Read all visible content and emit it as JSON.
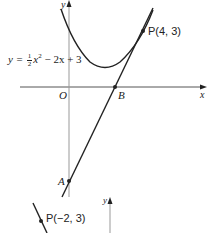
{
  "diagram": {
    "main_graph": {
      "x_axis_label": "x",
      "y_axis_label": "y",
      "origin_label": "O",
      "curve_equation": {
        "lhs": "y = ",
        "frac_num": "1",
        "frac_den": "2",
        "x_var": "x",
        "exp": "2",
        "rest": " − 2x + 3"
      },
      "points": [
        {
          "label": "P(4, 3)",
          "name": "P",
          "x": 4,
          "y": 3
        },
        {
          "label": "B",
          "name": "B",
          "x": 2.5,
          "y": 0
        },
        {
          "label": "A",
          "name": "A",
          "x": 0,
          "y": -5
        }
      ],
      "tangent_line": "y = 2x − 5"
    },
    "second_graph": {
      "y_axis_label": "y",
      "point_label": "P(−2, 3)"
    },
    "colors": {
      "curve": "#222222",
      "axis": "#888888",
      "background": "#ffffff"
    }
  }
}
